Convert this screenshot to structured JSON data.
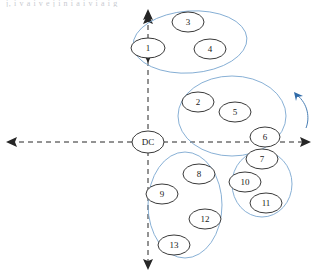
{
  "figure": {
    "top_cropped_text": "j, i v a i v e  j  i n i a i v i a i g",
    "origin_label": "DC",
    "accent_color": "#7ba7d0",
    "node_stroke_color": "#3a3a3a",
    "axis_color": "#262626",
    "rotation_arrow_color": "#2f6aa8"
  },
  "axes": {
    "horizontal": {
      "name": "horizontal-axis",
      "style": "dashed",
      "left_arrow": true,
      "right_arrow": true
    },
    "vertical": {
      "name": "vertical-axis",
      "style": "dashed",
      "top_arrow": true,
      "bottom_arrow": true
    }
  },
  "clusters": [
    {
      "id": "cluster-top",
      "cx": 190,
      "cy": 42,
      "rx": 57,
      "ry": 31,
      "rotation": -4,
      "nodes": [
        "1",
        "3",
        "4"
      ]
    },
    {
      "id": "cluster-middle-right",
      "cx": 232,
      "cy": 116,
      "rx": 54,
      "ry": 40,
      "rotation": 0,
      "nodes": [
        "2",
        "5",
        "6"
      ]
    },
    {
      "id": "cluster-lower-right",
      "cx": 262,
      "cy": 184,
      "rx": 30,
      "ry": 33,
      "rotation": 0,
      "nodes": [
        "7",
        "10",
        "11"
      ]
    },
    {
      "id": "cluster-bottom",
      "cx": 185,
      "cy": 205,
      "rx": 37,
      "ry": 53,
      "rotation": 0,
      "nodes": [
        "8",
        "9",
        "12",
        "13"
      ]
    }
  ],
  "nodes": [
    {
      "label": "1",
      "cx": 148,
      "cy": 48,
      "rx": 17,
      "ry": 10
    },
    {
      "label": "3",
      "cx": 188,
      "cy": 22,
      "rx": 16,
      "ry": 10
    },
    {
      "label": "4",
      "cx": 210,
      "cy": 49,
      "rx": 16,
      "ry": 10
    },
    {
      "label": "2",
      "cx": 198,
      "cy": 102,
      "rx": 16,
      "ry": 10
    },
    {
      "label": "5",
      "cx": 235,
      "cy": 112,
      "rx": 16,
      "ry": 10
    },
    {
      "label": "6",
      "cx": 265,
      "cy": 137,
      "rx": 15,
      "ry": 10
    },
    {
      "label": "7",
      "cx": 262,
      "cy": 159,
      "rx": 16,
      "ry": 10
    },
    {
      "label": "10",
      "cx": 245,
      "cy": 182,
      "rx": 16,
      "ry": 10
    },
    {
      "label": "11",
      "cx": 266,
      "cy": 203,
      "rx": 16,
      "ry": 10
    },
    {
      "label": "8",
      "cx": 199,
      "cy": 174,
      "rx": 16,
      "ry": 10
    },
    {
      "label": "9",
      "cx": 162,
      "cy": 194,
      "rx": 16,
      "ry": 10
    },
    {
      "label": "12",
      "cx": 205,
      "cy": 219,
      "rx": 16,
      "ry": 10
    },
    {
      "label": "13",
      "cx": 174,
      "cy": 245,
      "rx": 16,
      "ry": 10
    }
  ],
  "origin": {
    "cx": 148,
    "cy": 142,
    "rx": 16,
    "ry": 11
  },
  "rotation_arrow": {
    "name": "counterclockwise-rotation-arrow",
    "direction": "counterclockwise"
  }
}
